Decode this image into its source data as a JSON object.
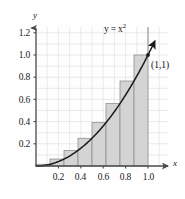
{
  "figure": {
    "axis_x_label": "x",
    "axis_y_label": "y",
    "curve_label_lhs": "y",
    "curve_label_eq": "=",
    "curve_label_base": "x",
    "curve_label_exp": "2",
    "point_label": "(1,1)"
  },
  "colors": {
    "bar_fill": "#d4d4d4",
    "bar_stroke": "#8a8a8a",
    "curve": "#1a1a1a",
    "axis": "#4a4a4a",
    "grid": "#d9dee4",
    "text": "#1a1a1a",
    "background": "#fefefe"
  },
  "chart_data": {
    "type": "area",
    "title": "",
    "subtitle": "",
    "xlabel": "x",
    "ylabel": "y",
    "xlim": [
      0,
      1.12
    ],
    "ylim": [
      0,
      1.28
    ],
    "grid": true,
    "grid_step_x": 0.1,
    "grid_step_y": 0.1,
    "legend": "none",
    "xticks": [
      0.2,
      0.4,
      0.6,
      0.8,
      1.0
    ],
    "xtick_labels": [
      "0.2",
      "0.4",
      "0.6",
      "0.8",
      "1.0"
    ],
    "yticks": [
      0.2,
      0.4,
      0.6,
      0.8,
      1.0,
      1.2
    ],
    "ytick_labels": [
      "0.2",
      "0.4",
      "0.6",
      "0.8",
      "1.0",
      "1.2"
    ],
    "series": [
      {
        "name": "y = x^2",
        "kind": "curve",
        "x": [
          0,
          0.1,
          0.2,
          0.3,
          0.4,
          0.5,
          0.6,
          0.7,
          0.8,
          0.9,
          1.0,
          1.06
        ],
        "values": [
          0,
          0.01,
          0.04,
          0.09,
          0.16,
          0.25,
          0.36,
          0.49,
          0.64,
          0.81,
          1.0,
          1.1236
        ]
      },
      {
        "name": "Right-endpoint rectangles (n = 8)",
        "kind": "bar",
        "n": 8,
        "interval": [
          0,
          1
        ],
        "width": 0.125,
        "left_edges": [
          0.0,
          0.125,
          0.25,
          0.375,
          0.5,
          0.625,
          0.75,
          0.875
        ],
        "right_edges": [
          0.125,
          0.25,
          0.375,
          0.5,
          0.625,
          0.75,
          0.875,
          1.0
        ],
        "values": [
          0.015625,
          0.0625,
          0.140625,
          0.25,
          0.390625,
          0.5625,
          0.765625,
          1.0
        ]
      }
    ],
    "annotations": [
      {
        "text": "y = x²",
        "x": 0.72,
        "y": 1.2
      },
      {
        "text": "(1,1)",
        "x": 1.03,
        "y": 0.97
      }
    ],
    "points": [
      {
        "label": "(1,1)",
        "x": 1.0,
        "y": 1.0
      }
    ]
  }
}
